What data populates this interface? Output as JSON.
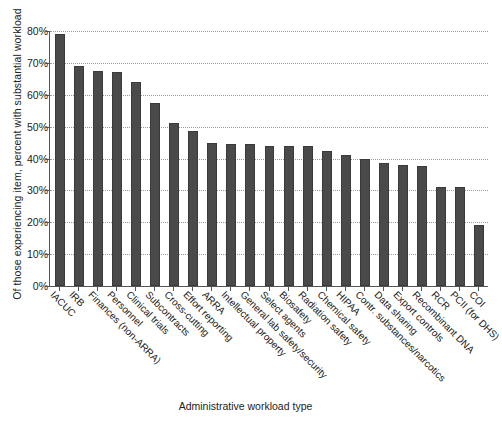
{
  "chart_data": {
    "type": "bar",
    "title": "",
    "xlabel": "Administrative workload type",
    "ylabel": "Of those experiencing item, percent with substantial workload",
    "ylim": [
      0,
      80
    ],
    "ytick_labels": [
      "0%",
      "10%",
      "20%",
      "30%",
      "40%",
      "50%",
      "60%",
      "70%",
      "80%"
    ],
    "ytick_values": [
      0,
      10,
      20,
      30,
      40,
      50,
      60,
      70,
      80
    ],
    "grid": true,
    "legend": "none",
    "bar_color": "#4a4a4a",
    "categories": [
      "IACUC",
      "IRB",
      "Finances (non-ARRA)",
      "Personnel",
      "Clinical trials",
      "Subcontracts",
      "Cross-cutting",
      "Effort reporting",
      "ARRA",
      "Intellectual property",
      "General lab safety/security",
      "Select agents",
      "Biosafety",
      "Radiation safety",
      "Chemical safety",
      "HIPAA",
      "Contr. substances/narcotics",
      "Data sharing",
      "Export controls",
      "Recombinant DNA",
      "RCR",
      "PCII (for DHS)",
      "COI"
    ],
    "values": [
      79,
      69,
      67.5,
      67,
      64,
      57.5,
      51,
      48.5,
      45,
      44.5,
      44.5,
      44,
      44,
      44,
      42.5,
      41,
      40,
      38.5,
      38,
      37.5,
      31,
      31,
      19
    ]
  }
}
